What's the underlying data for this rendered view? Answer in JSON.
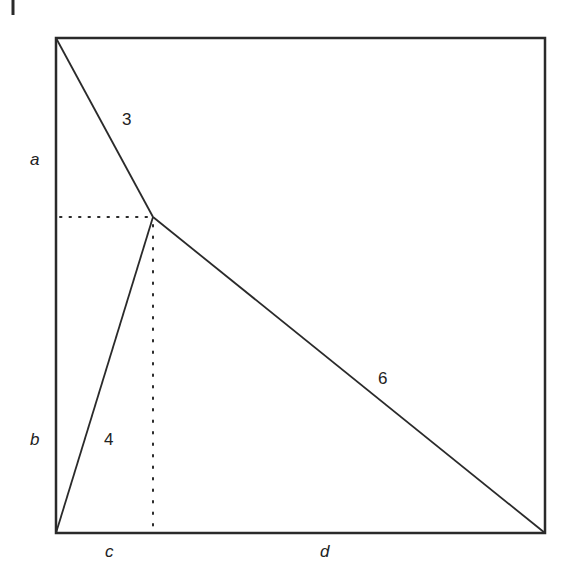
{
  "diagram": {
    "type": "geometry",
    "colors": {
      "stroke": "#2a2a2a",
      "background": "#ffffff"
    },
    "square": {
      "x1": 56,
      "y1": 38,
      "x2": 545,
      "y2": 533
    },
    "interior_point": {
      "x": 153,
      "y": 217
    },
    "segment_labels": {
      "top_left_to_point": "3",
      "bottom_left_to_point": "4",
      "bottom_right_to_point": "6"
    },
    "side_labels": {
      "a": "a",
      "b": "b",
      "c": "c",
      "d": "d"
    }
  }
}
